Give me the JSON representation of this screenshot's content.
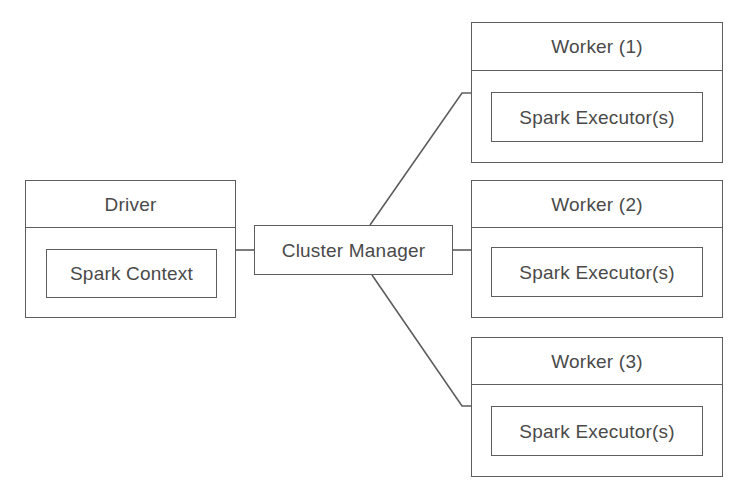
{
  "diagram": {
    "type": "block-diagram",
    "stroke_color": "#5d5d5d",
    "text_color": "#4a4a4a",
    "background_color": "#ffffff"
  },
  "driver": {
    "header_label": "Driver",
    "inner_label": "Spark Context"
  },
  "cluster_manager": {
    "label": "Cluster Manager"
  },
  "workers": [
    {
      "header_label": "Worker (1)",
      "inner_label": "Spark Executor(s)"
    },
    {
      "header_label": "Worker (2)",
      "inner_label": "Spark Executor(s)"
    },
    {
      "header_label": "Worker (3)",
      "inner_label": "Spark Executor(s)"
    }
  ],
  "connections": [
    {
      "from": "driver",
      "to": "cluster_manager"
    },
    {
      "from": "cluster_manager",
      "to": "worker_1"
    },
    {
      "from": "cluster_manager",
      "to": "worker_2"
    },
    {
      "from": "cluster_manager",
      "to": "worker_3"
    }
  ]
}
